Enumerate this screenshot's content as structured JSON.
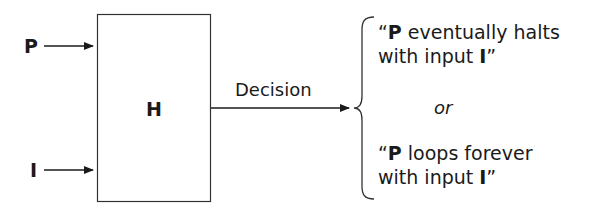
{
  "diagram": {
    "inputs": [
      {
        "label": "P"
      },
      {
        "label": "I"
      }
    ],
    "machine": {
      "label": "H"
    },
    "output_label": "Decision",
    "outcomes": {
      "first": {
        "open_quote": "“",
        "subject": "P",
        "line1_rest": " eventually halts",
        "line2_prefix": "with input ",
        "line2_bold": "I",
        "close_quote": "”"
      },
      "separator": "or",
      "second": {
        "open_quote": "“",
        "subject": "P",
        "line1_rest": " loops forever",
        "line2_prefix": "with input ",
        "line2_bold": "I",
        "close_quote": "”"
      }
    }
  }
}
